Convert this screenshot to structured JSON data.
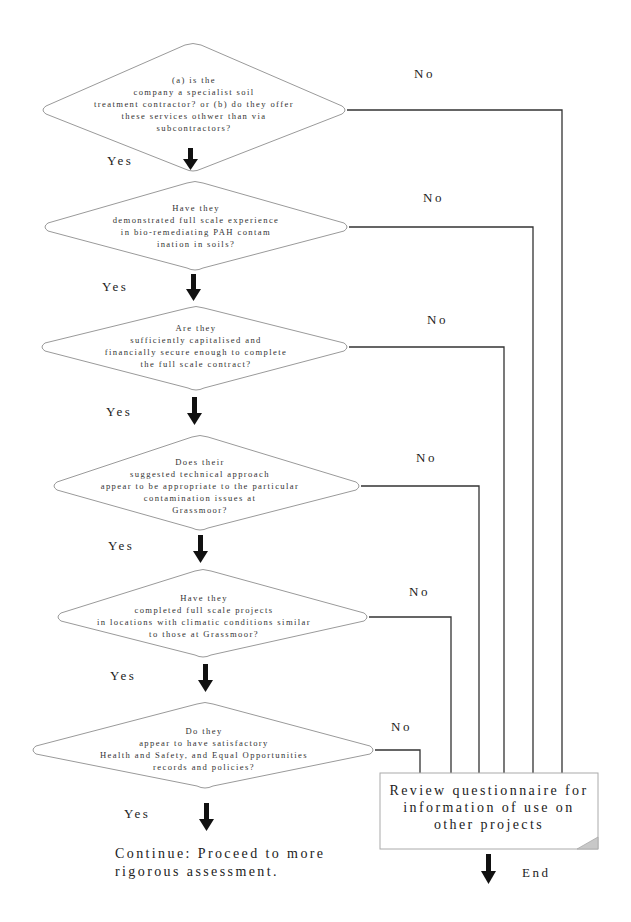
{
  "diagram": {
    "type": "decision-flowchart",
    "questions": [
      {
        "id": "q1",
        "text": "(a) is the\ncompany a specialist soil\ntreatment contractor? or (b) do they offer\nthese services othwer than via\nsubcontractors?",
        "yes_label": "Yes",
        "no_label": "No"
      },
      {
        "id": "q2",
        "text": "Have they\ndemonstrated full scale experience\nin bio-remediating PAH contam\nination in soils?",
        "yes_label": "Yes",
        "no_label": "No"
      },
      {
        "id": "q3",
        "text": "Are they\nsufficiently capitalised and\nfinancially secure enough to complete\nthe full scale contract?",
        "yes_label": "Yes",
        "no_label": "No"
      },
      {
        "id": "q4",
        "text": "Does their\nsuggested technical approach\nappear to be appropriate to the particular\ncontamination issues at\nGrassmoor?",
        "yes_label": "Yes",
        "no_label": "No"
      },
      {
        "id": "q5",
        "text": "Have they\ncompleted full scale projects\nin locations with climatic conditions similar\nto those at Grassmoor?",
        "yes_label": "Yes",
        "no_label": "No"
      },
      {
        "id": "q6",
        "text": "Do they\nappear to have satisfactory\nHealth and Safety, and Equal Opportunities\nrecords and policies?",
        "yes_label": "Yes",
        "no_label": "No"
      }
    ],
    "no_outcome": {
      "text": "Review questionnaire for\ninformation of use on\nother projects",
      "end_label": "End"
    },
    "yes_outcome": {
      "text": "Continue: Proceed to more\nrigorous assessment."
    },
    "colors": {
      "diamond_stroke": "#9a9a9a",
      "connector": "#333333",
      "arrow": "#111111",
      "box_fold": "#c8c8c8"
    }
  }
}
